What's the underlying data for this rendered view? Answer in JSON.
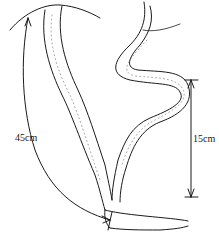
{
  "diagram": {
    "type": "anatomical-line-drawing",
    "colors": {
      "stroke": "#1a1a1a",
      "stipple": "#555555",
      "background": "#ffffff"
    },
    "measurements": [
      {
        "id": "left-arc",
        "label": "45cm",
        "style": "curved arrow along left loop"
      },
      {
        "id": "right-vertical",
        "label": "15cm",
        "style": "vertical double-headed arrow with end bars"
      }
    ]
  }
}
